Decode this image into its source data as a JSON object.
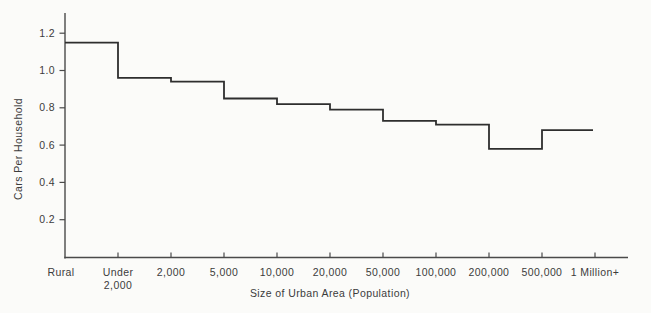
{
  "chart_data": {
    "type": "step",
    "title": "",
    "xlabel": "Size of Urban Area (Population)",
    "ylabel": "Cars Per Household",
    "x_tick_labels": [
      "Rural",
      "Under\n2,000",
      "2,000",
      "5,000",
      "10,000",
      "20,000",
      "50,000",
      "100,000",
      "200,000",
      "500,000",
      "1 Million+"
    ],
    "y_tick_labels": [
      "0.2",
      "0.4",
      "0.6",
      "0.8",
      "1.0",
      "1.2"
    ],
    "ylim": [
      0,
      1.3
    ],
    "grid": false,
    "legend": "none",
    "series_name": "Cars per household by size of urban area",
    "segments": [
      {
        "from": "Rural",
        "to": "Under 2,000",
        "value": 1.15
      },
      {
        "from": "Under 2,000",
        "to": "2,000",
        "value": 0.96
      },
      {
        "from": "2,000",
        "to": "5,000",
        "value": 0.94
      },
      {
        "from": "5,000",
        "to": "10,000",
        "value": 0.85
      },
      {
        "from": "10,000",
        "to": "20,000",
        "value": 0.82
      },
      {
        "from": "20,000",
        "to": "50,000",
        "value": 0.79
      },
      {
        "from": "50,000",
        "to": "100,000",
        "value": 0.73
      },
      {
        "from": "100,000",
        "to": "200,000",
        "value": 0.71
      },
      {
        "from": "200,000",
        "to": "500,000",
        "value": 0.58
      },
      {
        "from": "500,000",
        "to": "1 Million+",
        "value": 0.68
      }
    ],
    "colors": {
      "line": "#2e2e2e",
      "axis": "#4a4a4a",
      "text": "#3c3c3c",
      "background": "#fbfbf9"
    }
  }
}
